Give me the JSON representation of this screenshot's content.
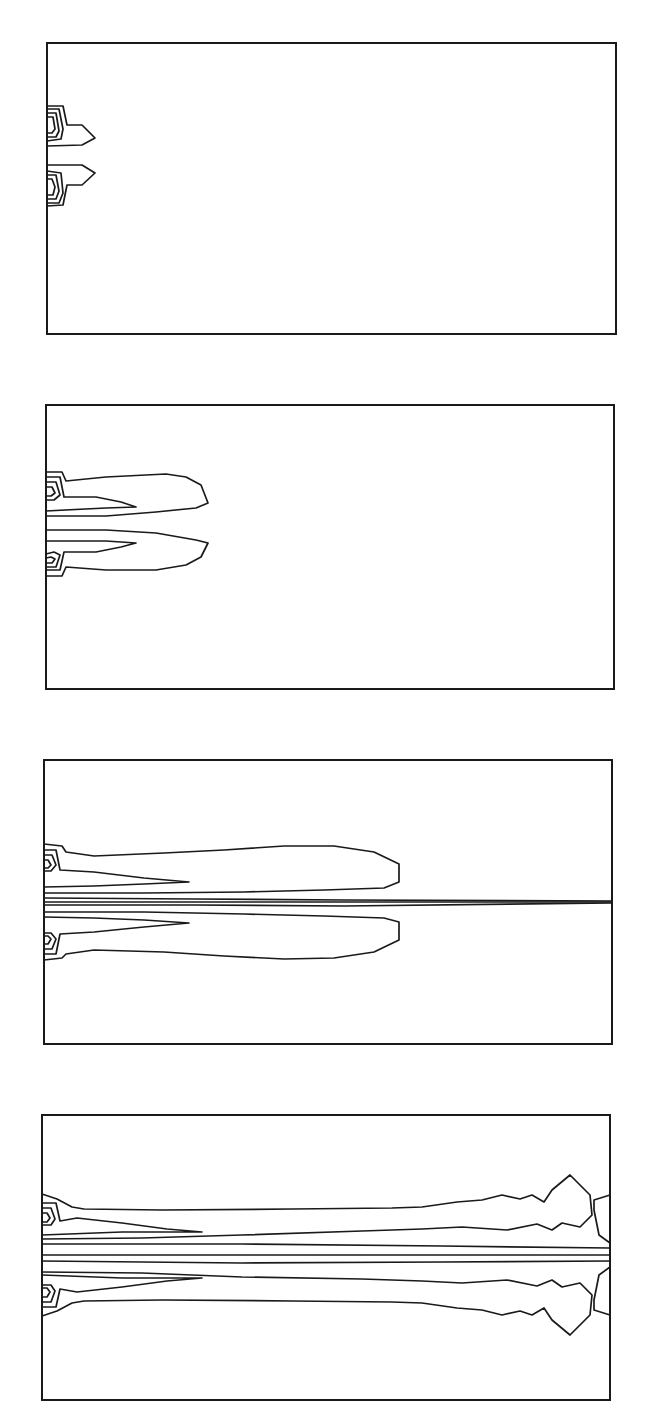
{
  "figure": {
    "line_color": "#1a1a1a",
    "background": "#ffffff",
    "panels": [
      {
        "index": 1,
        "stage": "early",
        "plume_extent_fraction": 0.09,
        "has_centerline": false
      },
      {
        "index": 2,
        "stage": "developing",
        "plume_extent_fraction": 0.28,
        "has_centerline": false
      },
      {
        "index": 3,
        "stage": "extended",
        "plume_extent_fraction": 0.62,
        "has_centerline": true
      },
      {
        "index": 4,
        "stage": "fully developed",
        "plume_extent_fraction": 1.0,
        "has_centerline": true
      }
    ]
  }
}
